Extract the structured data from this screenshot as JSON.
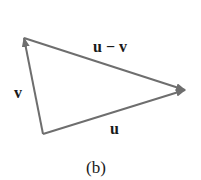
{
  "diagram": {
    "caption": "(b)",
    "line_color": "#6e6e6e",
    "text_color": "#1a1a1a",
    "vectors": [
      {
        "name": "u",
        "label": "u",
        "from": [
          43,
          134
        ],
        "to": [
          185,
          90
        ]
      },
      {
        "name": "v",
        "label": "v",
        "from": [
          43,
          134
        ],
        "to": [
          24,
          38
        ]
      },
      {
        "name": "u-minus-v",
        "label": "u − v",
        "from": [
          24,
          38
        ],
        "to": [
          185,
          90
        ]
      }
    ]
  }
}
